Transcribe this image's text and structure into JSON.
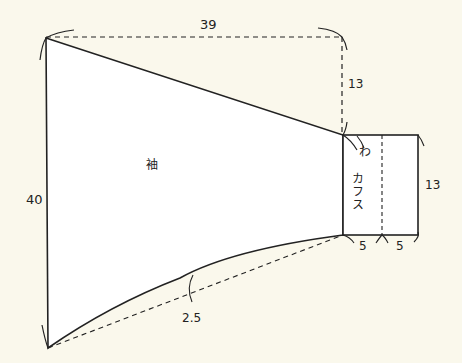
{
  "diagram": {
    "type": "sewing-pattern",
    "colors": {
      "background": "#faf8ec",
      "piece_fill": "#ffffff",
      "stroke": "#222222"
    },
    "pieces": [
      {
        "name": "sleeve",
        "label": "袖"
      },
      {
        "name": "cuff",
        "label": "カフス",
        "fold_mark": "わ"
      }
    ],
    "dimensions": {
      "sleeve_top_width": "39",
      "sleeve_slope_drop": "13",
      "sleeve_height": "40",
      "underarm_curve_depth": "2.5",
      "cuff_height": "13",
      "cuff_half_width_left": "5",
      "cuff_half_width_right": "5"
    }
  }
}
